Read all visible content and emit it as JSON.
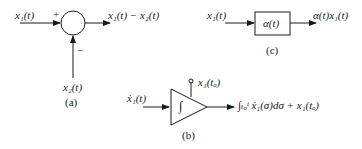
{
  "diagram": {
    "summer": {
      "input_label": "x₁(t)",
      "plus_sign": "+",
      "minus_sign": "−",
      "second_input_label": "x₂(t)",
      "output_label": "x₁(t) − x₂(t)",
      "caption": "(a)"
    },
    "multiplier": {
      "input_label": "x₁(t)",
      "block_label": "α(t)",
      "output_label": "α(t)x₁(t)",
      "caption": "(c)"
    },
    "integrator": {
      "input_label": "ẋ₁(t)",
      "symbol": "∫",
      "initial_condition_label": "x₁(tₒ)",
      "output_label": "∫ₜₒᵗ ẋ₁(σ)dσ + x₁(tₒ)",
      "caption": "(b)"
    }
  }
}
